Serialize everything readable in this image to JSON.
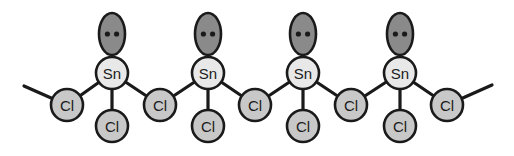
{
  "figure": {
    "background_color": "#ffffff",
    "stroke_color": "#1a1a1a",
    "bond_color": "#1a1a1a",
    "text_color": "#1a1a1a"
  },
  "legend": {
    "metal_label": "Sn",
    "halide_label": "Cl",
    "lone_pair_label": "lone pair"
  },
  "styles": {
    "lone_pair_fill": "#8a8a8a",
    "metal_fill": "#e8e8e8",
    "halide_fill": "#c8c8c8",
    "dot_fill": "#1a1a1a",
    "outline": "#1a1a1a",
    "outline_width": 2.6,
    "bond_width": 3.2,
    "metal_radius": 16,
    "halide_radius": 16,
    "lone_pair_rx": 13,
    "lone_pair_ry": 21,
    "dot_radius": 2.6,
    "metal_font_size": 15,
    "halide_font_size": 15
  },
  "chart_data": {
    "type": "diagram",
    "units": "pixels",
    "atoms": [
      {
        "id": "sn1",
        "element": "Sn",
        "label": "Sn",
        "x": 112,
        "y": 73,
        "kind": "metal"
      },
      {
        "id": "sn2",
        "element": "Sn",
        "label": "Sn",
        "x": 208,
        "y": 73,
        "kind": "metal"
      },
      {
        "id": "sn3",
        "element": "Sn",
        "label": "Sn",
        "x": 303,
        "y": 73,
        "kind": "metal"
      },
      {
        "id": "sn4",
        "element": "Sn",
        "label": "Sn",
        "x": 400,
        "y": 73,
        "kind": "metal"
      },
      {
        "id": "clb0",
        "element": "Cl",
        "label": "Cl",
        "x": 67,
        "y": 105,
        "kind": "bridging"
      },
      {
        "id": "clb1",
        "element": "Cl",
        "label": "Cl",
        "x": 160,
        "y": 105,
        "kind": "bridging"
      },
      {
        "id": "clb2",
        "element": "Cl",
        "label": "Cl",
        "x": 255,
        "y": 105,
        "kind": "bridging"
      },
      {
        "id": "clb3",
        "element": "Cl",
        "label": "Cl",
        "x": 351,
        "y": 105,
        "kind": "bridging"
      },
      {
        "id": "clb4",
        "element": "Cl",
        "label": "Cl",
        "x": 447,
        "y": 105,
        "kind": "bridging"
      },
      {
        "id": "clt1",
        "element": "Cl",
        "label": "Cl",
        "x": 112,
        "y": 126,
        "kind": "terminal"
      },
      {
        "id": "clt2",
        "element": "Cl",
        "label": "Cl",
        "x": 208,
        "y": 126,
        "kind": "terminal"
      },
      {
        "id": "clt3",
        "element": "Cl",
        "label": "Cl",
        "x": 303,
        "y": 126,
        "kind": "terminal"
      },
      {
        "id": "clt4",
        "element": "Cl",
        "label": "Cl",
        "x": 400,
        "y": 126,
        "kind": "terminal"
      }
    ],
    "lone_pairs": [
      {
        "id": "lp1",
        "owner": "sn1",
        "x": 112,
        "y": 34,
        "dots": 2
      },
      {
        "id": "lp2",
        "owner": "sn2",
        "x": 208,
        "y": 34,
        "dots": 2
      },
      {
        "id": "lp3",
        "owner": "sn3",
        "x": 303,
        "y": 34,
        "dots": 2
      },
      {
        "id": "lp4",
        "owner": "sn4",
        "x": 400,
        "y": 34,
        "dots": 2
      }
    ],
    "bonds": [
      {
        "id": "b-term-left",
        "from": {
          "x": 24,
          "y": 86
        },
        "to": {
          "x": 67,
          "y": 105
        },
        "kind": "continuation"
      },
      {
        "id": "b-clb0-sn1",
        "from": {
          "x": 67,
          "y": 105
        },
        "to": {
          "x": 112,
          "y": 73
        },
        "kind": "bridge"
      },
      {
        "id": "b-sn1-clb1",
        "from": {
          "x": 112,
          "y": 73
        },
        "to": {
          "x": 160,
          "y": 105
        },
        "kind": "bridge"
      },
      {
        "id": "b-clb1-sn2",
        "from": {
          "x": 160,
          "y": 105
        },
        "to": {
          "x": 208,
          "y": 73
        },
        "kind": "bridge"
      },
      {
        "id": "b-sn2-clb2",
        "from": {
          "x": 208,
          "y": 73
        },
        "to": {
          "x": 255,
          "y": 105
        },
        "kind": "bridge"
      },
      {
        "id": "b-clb2-sn3",
        "from": {
          "x": 255,
          "y": 105
        },
        "to": {
          "x": 303,
          "y": 73
        },
        "kind": "bridge"
      },
      {
        "id": "b-sn3-clb3",
        "from": {
          "x": 303,
          "y": 73
        },
        "to": {
          "x": 351,
          "y": 105
        },
        "kind": "bridge"
      },
      {
        "id": "b-clb3-sn4",
        "from": {
          "x": 351,
          "y": 105
        },
        "to": {
          "x": 400,
          "y": 73
        },
        "kind": "bridge"
      },
      {
        "id": "b-sn4-clb4",
        "from": {
          "x": 400,
          "y": 73
        },
        "to": {
          "x": 447,
          "y": 105
        },
        "kind": "bridge"
      },
      {
        "id": "b-term-right",
        "from": {
          "x": 447,
          "y": 105
        },
        "to": {
          "x": 492,
          "y": 85
        },
        "kind": "continuation"
      },
      {
        "id": "b-sn1-clt1",
        "from": {
          "x": 112,
          "y": 73
        },
        "to": {
          "x": 112,
          "y": 126
        },
        "kind": "terminal"
      },
      {
        "id": "b-sn2-clt2",
        "from": {
          "x": 208,
          "y": 73
        },
        "to": {
          "x": 208,
          "y": 126
        },
        "kind": "terminal"
      },
      {
        "id": "b-sn3-clt3",
        "from": {
          "x": 303,
          "y": 73
        },
        "to": {
          "x": 303,
          "y": 126
        },
        "kind": "terminal"
      },
      {
        "id": "b-sn4-clt4",
        "from": {
          "x": 400,
          "y": 73
        },
        "to": {
          "x": 400,
          "y": 126
        },
        "kind": "terminal"
      }
    ],
    "counts": {
      "sn_atoms": 4,
      "bridging_cl": 5,
      "terminal_cl": 4,
      "lone_pairs": 4,
      "repeat_unit": "SnCl2"
    }
  }
}
